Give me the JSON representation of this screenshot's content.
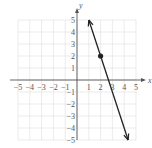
{
  "chart_data": {
    "type": "line",
    "title": "",
    "xlabel": "x",
    "ylabel": "y",
    "xlim": [
      -5,
      5
    ],
    "ylim": [
      -5,
      5
    ],
    "grid": true,
    "x_ticks": [
      "-5",
      "-4",
      "-3",
      "-2",
      "-1",
      "1",
      "2",
      "3",
      "4",
      "5"
    ],
    "y_ticks": [
      "5",
      "4",
      "3",
      "2",
      "1",
      "-1",
      "-2",
      "-3",
      "-4",
      "-5"
    ],
    "series": [
      {
        "name": "line",
        "equation": "y = -3x + 8",
        "x": [
          1,
          4.333
        ],
        "y": [
          5,
          -5
        ],
        "arrows": "both",
        "color": "#222222"
      }
    ],
    "points": [
      {
        "x": 2,
        "y": 2,
        "marker": "filled-circle"
      }
    ]
  },
  "axes": {
    "x_label": "x",
    "y_label": "y"
  },
  "colors": {
    "grid": "#dddddd",
    "axis": "#555555",
    "line": "#222222"
  }
}
